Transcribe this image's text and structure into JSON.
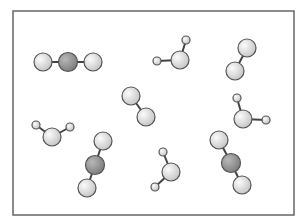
{
  "diagram": {
    "frame": {
      "x": 13,
      "y": 11,
      "width": 281,
      "height": 204,
      "stroke": "#666666"
    },
    "colors": {
      "light_atom_inner": "#fbfbfb",
      "light_atom_outer": "#c4c4c4",
      "dark_atom_inner": "#b8b8b8",
      "dark_atom_outer": "#7c7c7c",
      "outline": "#555555",
      "bond": "#444444"
    },
    "molecules": [
      {
        "type": "CO2",
        "atoms": [
          {
            "x": 43,
            "y": 62,
            "r": 9,
            "kind": "light"
          },
          {
            "x": 68,
            "y": 62,
            "r": 9.5,
            "kind": "dark"
          },
          {
            "x": 93,
            "y": 62,
            "r": 9,
            "kind": "light"
          }
        ]
      },
      {
        "type": "H2O",
        "atoms": [
          {
            "x": 180,
            "y": 60,
            "r": 9,
            "kind": "light"
          },
          {
            "x": 157,
            "y": 61,
            "r": 4,
            "kind": "light"
          },
          {
            "x": 186,
            "y": 40,
            "r": 4,
            "kind": "light"
          }
        ]
      },
      {
        "type": "diatomic",
        "atoms": [
          {
            "x": 247,
            "y": 48,
            "r": 9,
            "kind": "light"
          },
          {
            "x": 235,
            "y": 71,
            "r": 9,
            "kind": "light"
          }
        ]
      },
      {
        "type": "diatomic",
        "atoms": [
          {
            "x": 131,
            "y": 96,
            "r": 9,
            "kind": "light"
          },
          {
            "x": 146,
            "y": 117,
            "r": 9,
            "kind": "light"
          }
        ]
      },
      {
        "type": "H2O",
        "atoms": [
          {
            "x": 243,
            "y": 119,
            "r": 9,
            "kind": "light"
          },
          {
            "x": 237,
            "y": 98,
            "r": 4,
            "kind": "light"
          },
          {
            "x": 266,
            "y": 120,
            "r": 4,
            "kind": "light"
          }
        ]
      },
      {
        "type": "H2O",
        "atoms": [
          {
            "x": 52,
            "y": 137,
            "r": 9,
            "kind": "light"
          },
          {
            "x": 36,
            "y": 125,
            "r": 4,
            "kind": "light"
          },
          {
            "x": 70,
            "y": 127,
            "r": 4,
            "kind": "light"
          }
        ]
      },
      {
        "type": "CO2",
        "atoms": [
          {
            "x": 103,
            "y": 141,
            "r": 9,
            "kind": "light"
          },
          {
            "x": 95,
            "y": 165,
            "r": 9.5,
            "kind": "dark"
          },
          {
            "x": 87,
            "y": 188,
            "r": 9,
            "kind": "light"
          }
        ]
      },
      {
        "type": "H2O",
        "atoms": [
          {
            "x": 171,
            "y": 172,
            "r": 9,
            "kind": "light"
          },
          {
            "x": 163,
            "y": 152,
            "r": 4,
            "kind": "light"
          },
          {
            "x": 155,
            "y": 187,
            "r": 4,
            "kind": "light"
          }
        ]
      },
      {
        "type": "CO2",
        "atoms": [
          {
            "x": 219,
            "y": 140,
            "r": 9,
            "kind": "light"
          },
          {
            "x": 231,
            "y": 163,
            "r": 9.5,
            "kind": "dark"
          },
          {
            "x": 242,
            "y": 185,
            "r": 9,
            "kind": "light"
          }
        ]
      }
    ]
  }
}
